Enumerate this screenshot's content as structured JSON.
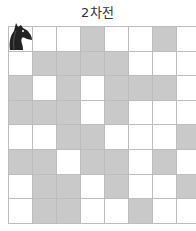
{
  "title": "2차전",
  "board": {
    "rows": 8,
    "cols": 8,
    "colors": {
      "light": "#ffffff",
      "shaded": "#c9c9c9",
      "grid": "#bdbdbd",
      "piece": "#222222"
    },
    "cells": [
      [
        "W",
        "W",
        "W",
        "G",
        "W",
        "W",
        "G",
        "W"
      ],
      [
        "W",
        "G",
        "G",
        "G",
        "G",
        "W",
        "W",
        "W"
      ],
      [
        "G",
        "W",
        "G",
        "W",
        "G",
        "G",
        "G",
        "W"
      ],
      [
        "G",
        "G",
        "G",
        "W",
        "G",
        "W",
        "W",
        "W"
      ],
      [
        "W",
        "W",
        "G",
        "G",
        "W",
        "W",
        "W",
        "G"
      ],
      [
        "G",
        "G",
        "W",
        "G",
        "G",
        "W",
        "G",
        "W"
      ],
      [
        "W",
        "G",
        "G",
        "W",
        "G",
        "W",
        "W",
        "G"
      ],
      [
        "W",
        "G",
        "G",
        "W",
        "W",
        "G",
        "W",
        "W"
      ]
    ],
    "piece": {
      "type": "knight-icon",
      "row": 0,
      "col": 0
    }
  }
}
